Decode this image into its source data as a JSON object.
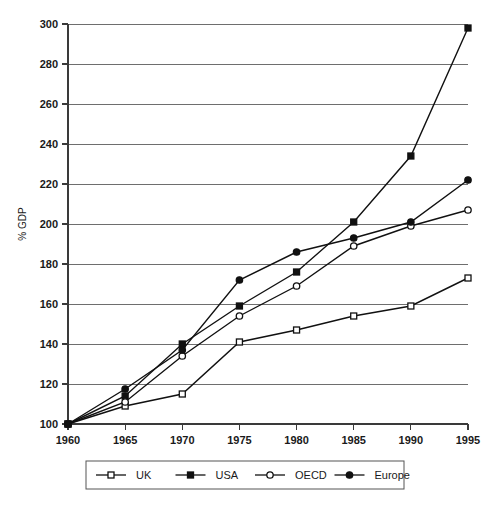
{
  "chart_data": {
    "type": "line",
    "title": "",
    "xlabel": "",
    "ylabel": "% GDP",
    "x": [
      1960,
      1965,
      1970,
      1975,
      1980,
      1985,
      1990,
      1995
    ],
    "xtick_labels": [
      "1960",
      "1965",
      "1970",
      "1975",
      "1980",
      "1985",
      "1990",
      "1995"
    ],
    "ytick_labels": [
      "100",
      "120",
      "140",
      "160",
      "180",
      "200",
      "220",
      "240",
      "260",
      "280",
      "300"
    ],
    "ylim": [
      100,
      300
    ],
    "xlim": [
      1960,
      1995
    ],
    "grid": "horizontal",
    "legend_position": "bottom",
    "series": [
      {
        "name": "UK",
        "marker": "open-square",
        "color": "#111111",
        "values": [
          100,
          109,
          115,
          141,
          147,
          154,
          159,
          173
        ]
      },
      {
        "name": "USA",
        "marker": "filled-square",
        "color": "#111111",
        "values": [
          100,
          114,
          140,
          159,
          176,
          201,
          234,
          298
        ]
      },
      {
        "name": "OECD",
        "marker": "open-circle",
        "color": "#111111",
        "values": [
          100,
          111,
          134,
          154,
          169,
          189,
          199,
          207
        ]
      },
      {
        "name": "Europe",
        "marker": "filled-circle",
        "color": "#111111",
        "values": [
          100,
          117.5,
          137,
          172,
          186,
          193,
          201,
          222
        ]
      }
    ]
  },
  "legend": {
    "entries": [
      {
        "label": "UK"
      },
      {
        "label": "USA"
      },
      {
        "label": "OECD"
      },
      {
        "label": "Europe"
      }
    ]
  }
}
